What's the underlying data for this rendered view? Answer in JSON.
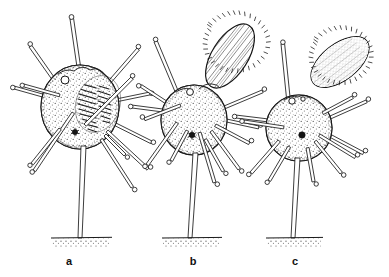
{
  "figure": {
    "kind": "scientific-line-drawing",
    "background_color": "#ffffff",
    "ink_color": "#1a1a1a",
    "width": 389,
    "height": 277,
    "caption_labels": [
      "a",
      "b",
      "c"
    ],
    "specimens": [
      {
        "label": "a",
        "label_x": 69,
        "label_y": 261,
        "body": {
          "center_x": 80,
          "center_y": 107,
          "radius_x": 39,
          "radius_y": 42,
          "fill": "#ffffff",
          "texture": "stippled",
          "pore_x": 65,
          "pore_y": 80,
          "pore_r": 4,
          "nucleus_x": 75,
          "nucleus_y": 132,
          "nucleus_r": 2.6,
          "internal_patch": "hatched-striated-mass",
          "internal_patch_x": 98,
          "internal_patch_y": 104
        },
        "appendage": {
          "present": false,
          "type": "none"
        },
        "stalk": {
          "top_x": 84,
          "top_y": 147,
          "base_x": 80,
          "base_y": 238
        },
        "ground": {
          "x1": 51,
          "x2": 112,
          "y": 238
        },
        "spine_count": 13
      },
      {
        "label": "b",
        "label_x": 193,
        "label_y": 261,
        "body": {
          "center_x": 194,
          "center_y": 120,
          "radius_x": 33,
          "radius_y": 35,
          "fill": "#ffffff",
          "texture": "stippled",
          "pore_x": 190,
          "pore_y": 92,
          "pore_r": 3.4,
          "nucleus_x": 192,
          "nucleus_y": 135,
          "nucleus_r": 2.8,
          "internal_patch": "none"
        },
        "appendage": {
          "present": true,
          "type": "ovoid-spore-hatched",
          "center_x": 230,
          "center_y": 56,
          "radius_major": 36,
          "radius_minor": 18,
          "rotation_deg": -58,
          "border": "spiky-fringed",
          "interior": "longitudinal-hatch-lines",
          "attached": true
        },
        "stalk": {
          "top_x": 196,
          "top_y": 155,
          "base_x": 190,
          "base_y": 238
        },
        "ground": {
          "x1": 162,
          "x2": 222,
          "y": 238
        },
        "spine_count": 12
      },
      {
        "label": "c",
        "label_x": 295,
        "label_y": 261,
        "body": {
          "center_x": 299,
          "center_y": 128,
          "radius_x": 33,
          "radius_y": 33,
          "fill": "#ffffff",
          "texture": "stippled",
          "pore_x": 292,
          "pore_y": 101,
          "pore_r": 3.2,
          "pore2_x": 303,
          "pore2_y": 99,
          "pore2_r": 2.2,
          "nucleus_x": 302,
          "nucleus_y": 135,
          "nucleus_r": 3.2,
          "internal_patch": "none"
        },
        "appendage": {
          "present": true,
          "type": "ovoid-spore-stippled",
          "center_x": 340,
          "center_y": 62,
          "radius_major": 34,
          "radius_minor": 18,
          "rotation_deg": -38,
          "border": "spiky-fringed",
          "interior": "fine-stipple",
          "attached": false
        },
        "stalk": {
          "top_x": 297,
          "top_y": 160,
          "base_x": 293,
          "base_y": 238
        },
        "ground": {
          "x1": 266,
          "x2": 323,
          "y": 238
        },
        "spine_count": 12
      }
    ],
    "spine_style": {
      "description": "double-line tubular shaft with small knobbed tip",
      "tip_shape": "knob",
      "tip_radius": 2.2
    },
    "substrate_style": {
      "description": "thin horizontal line with stipple beneath",
      "color": "#1a1a1a"
    }
  }
}
